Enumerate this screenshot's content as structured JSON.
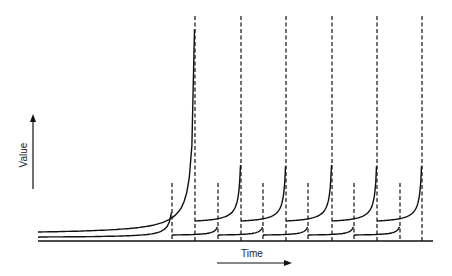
{
  "chart_data": {
    "type": "line",
    "title": "",
    "xlabel": "Time",
    "ylabel": "Value",
    "grid": false,
    "legend": null,
    "axis_arrows": true,
    "tall_event_x_px": [
      195,
      241,
      286,
      332,
      377,
      422
    ],
    "short_event_x_px": [
      172,
      218,
      263,
      308,
      354,
      400
    ],
    "baseline_y_px": 241,
    "colors": {
      "line": "#111111",
      "background": "#ffffff"
    }
  },
  "labels": {
    "x_axis": "Time",
    "y_axis": "Value"
  }
}
